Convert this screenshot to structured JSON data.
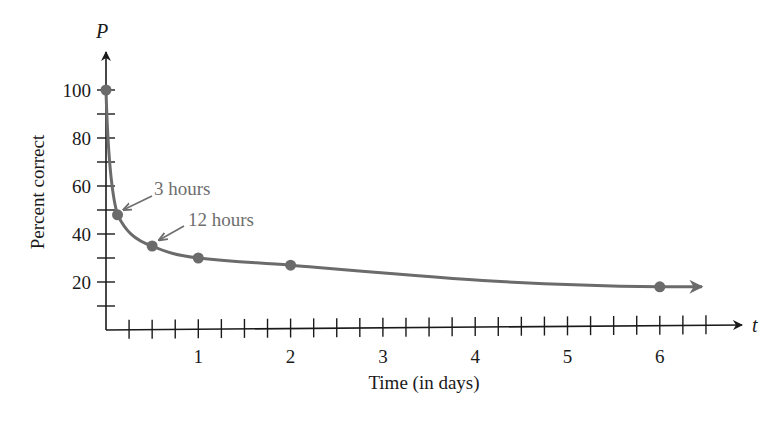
{
  "chart_data": {
    "type": "line",
    "title": "",
    "xlabel": "Time (in days)",
    "ylabel": "Percent correct",
    "x_axis_variable": "t",
    "y_axis_variable": "P",
    "xlim": [
      0,
      6.5
    ],
    "ylim": [
      0,
      110
    ],
    "x_ticks": [
      1,
      2,
      3,
      4,
      5,
      6
    ],
    "x_tick_labels": [
      "1",
      "2",
      "3",
      "4",
      "5",
      "6"
    ],
    "x_minor_tick_step": 0.25,
    "y_ticks": [
      20,
      40,
      60,
      80,
      100
    ],
    "y_tick_labels": [
      "20",
      "40",
      "60",
      "80",
      "100"
    ],
    "y_minor_tick_step": 10,
    "grid": false,
    "legend": null,
    "series": [
      {
        "name": "Percent correct",
        "color": "#6b6b6b",
        "x": [
          0,
          0.125,
          0.5,
          1,
          2,
          6
        ],
        "values": [
          100,
          48,
          35,
          30,
          27,
          18
        ],
        "markers": true,
        "continues_arrow": true
      }
    ],
    "annotations": [
      {
        "text": "3 hours",
        "x": 0.125,
        "y": 48
      },
      {
        "text": "12 hours",
        "x": 0.5,
        "y": 35
      }
    ]
  },
  "colors": {
    "axis": "#1a1a1a",
    "curve": "#6b6b6b",
    "annotation": "#6e6e6e"
  }
}
